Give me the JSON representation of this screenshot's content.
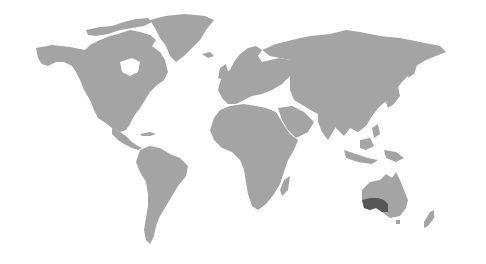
{
  "map": {
    "type": "world-choropleth",
    "background_color": "#ffffff",
    "land_color": "#a4a4a4",
    "highlight_color": "#565656",
    "highlighted_regions": [
      {
        "name": "Southern Australia (South Australia / southern Western Australia)",
        "color": "#565656"
      }
    ],
    "continents": [
      "North America",
      "Greenland",
      "South America",
      "Europe",
      "Africa",
      "Asia",
      "Australia",
      "New Zealand"
    ]
  }
}
